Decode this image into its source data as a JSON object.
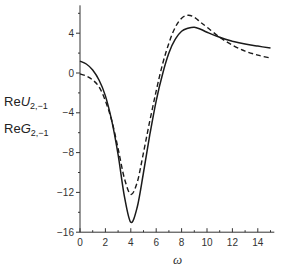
{
  "chart_data": {
    "type": "line",
    "title": "",
    "xlabel": "ω",
    "ylabel_lines": [
      {
        "prefix": "Re",
        "var": "U",
        "sub": "2,−1"
      },
      {
        "prefix": "Re",
        "var": "G",
        "sub": "2,−1"
      }
    ],
    "xlim": [
      0,
      15.3
    ],
    "ylim": [
      -16,
      6.8
    ],
    "x_ticks": [
      0,
      2,
      4,
      6,
      8,
      10,
      12,
      14
    ],
    "y_ticks": [
      4,
      0,
      -4,
      -8,
      -12,
      -16
    ],
    "grid": false,
    "legend": "none (solid = ReU, dashed = ReG)",
    "series": [
      {
        "name": "ReU_{2,-1}",
        "style": "solid",
        "x": [
          0,
          0.5,
          1,
          1.5,
          2,
          2.5,
          3,
          3.5,
          4,
          4.5,
          5,
          5.5,
          6,
          6.5,
          7,
          7.5,
          8,
          8.5,
          9,
          9.5,
          10,
          11,
          12,
          13,
          14,
          15
        ],
        "y": [
          1.2,
          0.9,
          0.3,
          -0.7,
          -2.3,
          -4.8,
          -8.2,
          -12.4,
          -15.0,
          -13.5,
          -10.0,
          -6.2,
          -2.8,
          -0.1,
          2.0,
          3.4,
          4.2,
          4.5,
          4.6,
          4.4,
          4.1,
          3.6,
          3.2,
          2.9,
          2.7,
          2.5
        ]
      },
      {
        "name": "ReG_{2,-1}",
        "style": "dashed",
        "x": [
          0,
          0.5,
          1,
          1.5,
          2,
          2.5,
          3,
          3.5,
          4,
          4.5,
          5,
          5.5,
          6,
          6.5,
          7,
          7.5,
          8,
          8.5,
          9,
          9.5,
          10,
          11,
          12,
          13,
          14,
          15
        ],
        "y": [
          -0.1,
          -0.3,
          -0.7,
          -1.4,
          -2.8,
          -4.8,
          -7.6,
          -10.6,
          -12.2,
          -11.0,
          -8.0,
          -4.8,
          -1.8,
          0.9,
          3.0,
          4.6,
          5.5,
          5.8,
          5.6,
          5.1,
          4.6,
          3.6,
          2.8,
          2.2,
          1.8,
          1.5
        ]
      }
    ]
  },
  "axes": {
    "x_tick_labels": [
      "0",
      "2",
      "4",
      "6",
      "8",
      "10",
      "12",
      "14"
    ],
    "y_tick_labels": [
      "4",
      "0",
      "−4",
      "−8",
      "−12",
      "−16"
    ],
    "xlabel": "ω",
    "ylabel_line1": {
      "prefix": "Re",
      "var": "U",
      "sub": "2,−1"
    },
    "ylabel_line2": {
      "prefix": "Re",
      "var": "G",
      "sub": "2,−1"
    }
  },
  "colors": {
    "line": "#1a1a1a",
    "axis": "#333333"
  }
}
